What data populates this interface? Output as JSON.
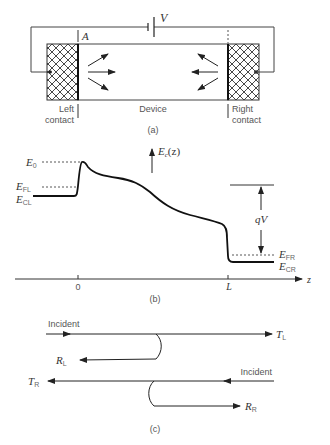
{
  "panel_a": {
    "caption": "(a)",
    "voltage_label": "V",
    "boundary_label": "A",
    "left_contact": [
      "Left",
      "contact"
    ],
    "device_label": "Device",
    "right_contact": [
      "Right",
      "contact"
    ]
  },
  "panel_b": {
    "caption": "(b)",
    "axis_label": "E",
    "axis_label_sub": "c",
    "axis_label_arg": "(z)",
    "z_label": "z",
    "tick_0": "0",
    "tick_L": "L",
    "E0": {
      "main": "E",
      "sub": "0"
    },
    "EFL": {
      "main": "E",
      "sub": "FL"
    },
    "ECL": {
      "main": "E",
      "sub": "CL"
    },
    "EFR": {
      "main": "E",
      "sub": "FR"
    },
    "ECR": {
      "main": "E",
      "sub": "CR"
    },
    "qV": "qV"
  },
  "panel_c": {
    "caption": "(c)",
    "incident_left": "Incident",
    "incident_right": "Incident",
    "TL": {
      "main": "T",
      "sub": "L"
    },
    "RL": {
      "main": "R",
      "sub": "L"
    },
    "TR": {
      "main": "T",
      "sub": "R"
    },
    "RR": {
      "main": "R",
      "sub": "R"
    }
  }
}
